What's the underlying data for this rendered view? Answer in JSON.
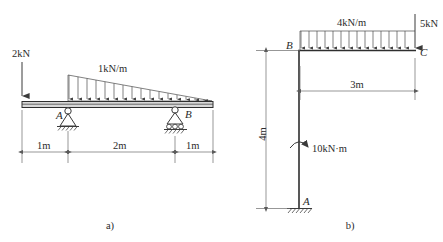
{
  "figure": {
    "title_a": "a)",
    "title_b": "b)"
  },
  "panel_a": {
    "caption": "a)",
    "point_load_label": "2kN",
    "distributed_load_label": "1kN/m",
    "support_a_label": "A",
    "support_b_label": "B",
    "support_a_type": "pin-support",
    "support_b_type": "roller-support",
    "dimensions": [
      {
        "label": "1m",
        "value": 1,
        "unit": "m"
      },
      {
        "label": "2m",
        "value": 2,
        "unit": "m"
      },
      {
        "label": "1m",
        "value": 1,
        "unit": "m"
      }
    ],
    "loads": [
      {
        "type": "point",
        "label": "2kN",
        "magnitude": 2,
        "unit": "kN",
        "direction": "down",
        "position_m": 0
      },
      {
        "type": "triangular-distributed",
        "label": "1kN/m",
        "peak": 1,
        "unit": "kN/m",
        "direction": "down",
        "from_m": 1,
        "to_m": 4,
        "peak_at": "left"
      }
    ]
  },
  "panel_b": {
    "caption": "b)",
    "distributed_load_label": "4kN/m",
    "point_load_label": "5kN",
    "moment_label": "10kN·m",
    "joint_b_label": "B",
    "joint_c_label": "C",
    "support_a_label": "A",
    "support_a_type": "fixed-support",
    "dimension_vertical": {
      "label": "4m",
      "value": 4,
      "unit": "m"
    },
    "dimension_horizontal": {
      "label": "3m",
      "value": 3,
      "unit": "m"
    },
    "loads": [
      {
        "type": "uniform-distributed",
        "label": "4kN/m",
        "magnitude": 4,
        "unit": "kN/m",
        "direction": "down",
        "span_m": 3
      },
      {
        "type": "point",
        "label": "5kN",
        "magnitude": 5,
        "unit": "kN",
        "direction": "down",
        "at": "C"
      },
      {
        "type": "moment",
        "label": "10kN·m",
        "magnitude": 10,
        "unit": "kN·m",
        "sense": "clockwise",
        "at_m_from_base": 2
      }
    ]
  },
  "colors": {
    "line": "#3a3a3a",
    "beam_fill": "#d8d8d8",
    "dimension": "#6a6a6a",
    "text": "#2b2b2b"
  }
}
